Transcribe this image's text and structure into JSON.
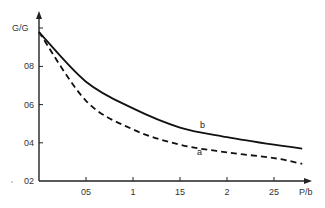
{
  "chart_data": {
    "type": "line",
    "title": "",
    "xlabel": "P/b",
    "ylabel": "G/G",
    "xlim": [
      0,
      2.8
    ],
    "ylim": [
      0.2,
      1.0
    ],
    "grid": false,
    "x_ticks": [
      0.5,
      1,
      1.5,
      2,
      2.5
    ],
    "x_tick_labels": [
      "05",
      "1",
      "15",
      "2",
      "25"
    ],
    "y_ticks": [
      0.2,
      0.4,
      0.6,
      0.8
    ],
    "y_tick_labels": [
      "02",
      "04",
      "06",
      "08"
    ],
    "x": [
      0,
      0.5,
      1.0,
      1.5,
      2.0,
      2.5,
      2.8
    ],
    "series": [
      {
        "name": "b",
        "style": "solid",
        "values": [
          0.98,
          0.72,
          0.58,
          0.48,
          0.43,
          0.39,
          0.37
        ]
      },
      {
        "name": "a",
        "style": "dashed",
        "values": [
          0.98,
          0.62,
          0.47,
          0.39,
          0.35,
          0.32,
          0.29
        ]
      }
    ],
    "annotations": [
      {
        "text": "b",
        "x": 1.7,
        "y": 0.47
      },
      {
        "text": "a",
        "x": 1.68,
        "y": 0.34
      }
    ]
  }
}
